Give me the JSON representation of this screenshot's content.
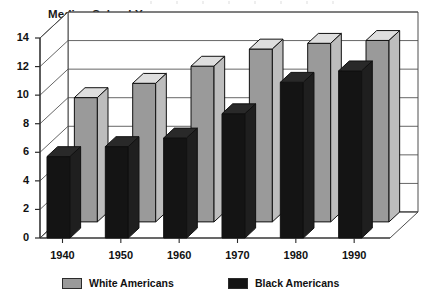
{
  "chart_data": {
    "type": "bar",
    "title": "Median School Years",
    "xlabel": "",
    "ylabel": "",
    "categories": [
      "1940",
      "1950",
      "1960",
      "1970",
      "1980",
      "1990"
    ],
    "series": [
      {
        "name": "White Americans",
        "color": "#9a9a9a",
        "values": [
          8.7,
          9.7,
          10.9,
          12.1,
          12.5,
          12.7
        ]
      },
      {
        "name": "Black Americans",
        "color": "#141414",
        "values": [
          5.7,
          6.4,
          7.0,
          8.7,
          10.9,
          11.7
        ]
      }
    ],
    "ylim": [
      0,
      14
    ],
    "yticks": [
      0,
      2,
      4,
      6,
      8,
      10,
      12,
      14
    ],
    "ytick_labels": [
      "0",
      "2",
      "4",
      "6",
      "8",
      "10",
      "12",
      "14"
    ],
    "grid": true,
    "legend_position": "bottom",
    "style": "3d-grouped-bar"
  },
  "legend": {
    "items": [
      {
        "label": "White Americans"
      },
      {
        "label": "Black Americans"
      }
    ]
  }
}
